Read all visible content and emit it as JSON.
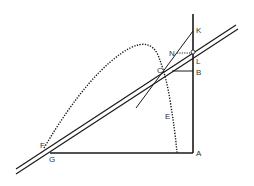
{
  "diagram": {
    "type": "geometric-construction",
    "colors": {
      "stroke": "#1a1a1a",
      "background": "#ffffff",
      "label": "#333333"
    },
    "labels": {
      "K": "K",
      "N": "N",
      "L": "L",
      "C": "C",
      "B": "B",
      "E": "E",
      "A": "A",
      "G": "G",
      "F": "F"
    },
    "points": {
      "K": [
        193,
        31
      ],
      "N": [
        176,
        53
      ],
      "L": [
        193,
        58
      ],
      "C": [
        165,
        73
      ],
      "B": [
        193,
        71
      ],
      "E": [
        160,
        115
      ],
      "A": [
        193,
        153
      ],
      "G": [
        52,
        153
      ]
    },
    "elements": [
      "vertical-line-KA",
      "horizontal-line-GA",
      "double-line-through-G-and-L",
      "tangent-line-through-C-and-K",
      "dotted-parabolic-trajectory",
      "dotted-segment-N-to-vertical",
      "segment-C-to-B"
    ]
  }
}
